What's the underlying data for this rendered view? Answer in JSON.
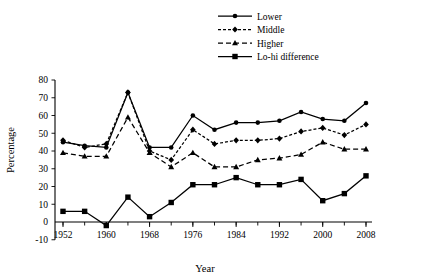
{
  "chart_data": {
    "type": "line",
    "title": "",
    "xlabel": "Year",
    "ylabel": "Percentage",
    "x": [
      1952,
      1956,
      1960,
      1964,
      1968,
      1972,
      1976,
      1980,
      1984,
      1988,
      1992,
      1996,
      2000,
      2004,
      2008
    ],
    "xticks": [
      1952,
      1960,
      1968,
      1976,
      1984,
      1992,
      2000,
      2008
    ],
    "yticks": [
      -10,
      0,
      10,
      20,
      30,
      40,
      50,
      60,
      70,
      80
    ],
    "xlim": [
      1950,
      2010
    ],
    "ylim": [
      -10,
      80
    ],
    "grid": false,
    "legend_position": "top-right",
    "series": [
      {
        "name": "Lower",
        "marker": "circle",
        "line_style": "solid",
        "color": "#000000",
        "values": [
          45,
          43,
          42,
          73,
          42,
          42,
          60,
          52,
          56,
          56,
          57,
          62,
          58,
          57,
          67
        ]
      },
      {
        "name": "Middle",
        "marker": "diamond",
        "line_style": "dotted",
        "color": "#000000",
        "values": [
          46,
          42,
          44,
          73,
          40,
          35,
          52,
          44,
          46,
          46,
          47,
          51,
          53,
          49,
          55
        ]
      },
      {
        "name": "Higher",
        "marker": "triangle",
        "line_style": "dashed",
        "color": "#000000",
        "values": [
          39,
          37,
          37,
          59,
          39,
          31,
          39,
          31,
          31,
          35,
          36,
          38,
          45,
          41,
          41
        ]
      },
      {
        "name": "Lo-hi difference",
        "marker": "square",
        "line_style": "solid",
        "color": "#000000",
        "values": [
          6,
          6,
          -2,
          14,
          3,
          11,
          21,
          21,
          25,
          21,
          21,
          24,
          12,
          16,
          26
        ]
      }
    ]
  },
  "legend": {
    "items": [
      {
        "label": "Lower"
      },
      {
        "label": "Middle"
      },
      {
        "label": "Higher"
      },
      {
        "label": "Lo-hi difference"
      }
    ]
  },
  "axes": {
    "y_title": "Percentage",
    "x_title": "Year",
    "y_tick_labels": [
      "80",
      "70",
      "60",
      "50",
      "40",
      "30",
      "20",
      "10",
      "0",
      "-10"
    ],
    "x_tick_labels": [
      "1952",
      "1960",
      "1968",
      "1976",
      "1984",
      "1992",
      "2000",
      "2008"
    ]
  }
}
